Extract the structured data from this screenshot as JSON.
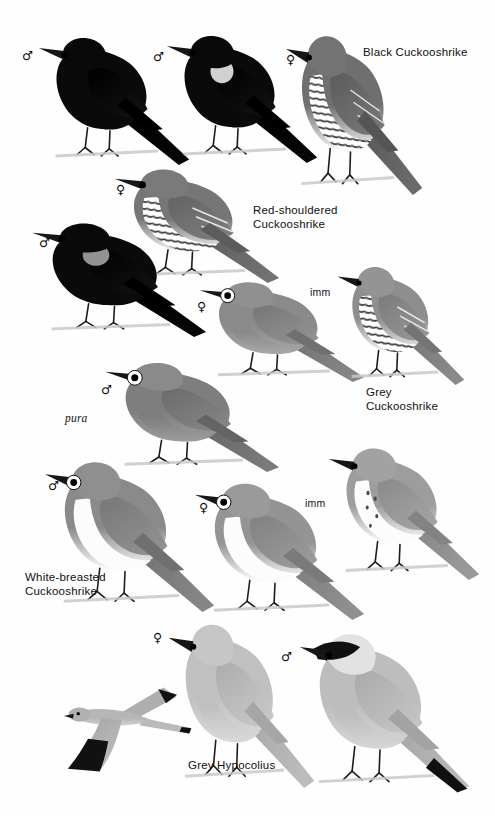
{
  "plate": {
    "title": "Cuckooshrikes and Grey Hypocolius",
    "width": 495,
    "height": 816,
    "background": "#ffffff"
  },
  "species_labels": [
    {
      "name": "black-cuckooshrike",
      "text": "Black Cuckooshrike",
      "x": 363,
      "y": 46
    },
    {
      "name": "red-shouldered-cuckooshrike",
      "text": "Red-shouldered\nCuckooshrike",
      "x": 253,
      "y": 204
    },
    {
      "name": "grey-cuckooshrike",
      "text": "Grey\nCuckooshrike",
      "x": 366,
      "y": 386
    },
    {
      "name": "white-breasted-cuckooshrike",
      "text": "White-breasted\nCuckooshrike",
      "x": 25,
      "y": 571
    },
    {
      "name": "grey-hypocolius",
      "text": "Grey Hypocolius",
      "x": 188,
      "y": 759
    }
  ],
  "age_labels": [
    {
      "name": "imm-grey-cuckooshrike",
      "text": "imm",
      "x": 310,
      "y": 286
    },
    {
      "name": "imm-white-breasted-cuckooshrike",
      "text": "imm",
      "x": 305,
      "y": 497
    }
  ],
  "subspecies_labels": [
    {
      "name": "pura-subspecies",
      "text": "pura",
      "x": 65,
      "y": 412
    }
  ],
  "sex_symbols": [
    {
      "name": "male-black-cuckooshrike-left",
      "symbol": "♂",
      "x": 22,
      "y": 50
    },
    {
      "name": "male-black-cuckooshrike-right",
      "symbol": "♂",
      "x": 153,
      "y": 51
    },
    {
      "name": "female-black-cuckooshrike",
      "symbol": "♀",
      "x": 286,
      "y": 54
    },
    {
      "name": "female-red-shouldered-cuckooshrike",
      "symbol": "♀",
      "x": 116,
      "y": 184
    },
    {
      "name": "male-red-shouldered-cuckooshrike",
      "symbol": "♂",
      "x": 39,
      "y": 237
    },
    {
      "name": "female-grey-cuckooshrike",
      "symbol": "♀",
      "x": 197,
      "y": 301
    },
    {
      "name": "male-grey-cuckooshrike-pura",
      "symbol": "♂",
      "x": 101,
      "y": 384
    },
    {
      "name": "male-white-breasted-cuckooshrike",
      "symbol": "♂",
      "x": 48,
      "y": 480
    },
    {
      "name": "female-white-breasted-cuckooshrike",
      "symbol": "♀",
      "x": 199,
      "y": 502
    },
    {
      "name": "female-grey-hypocolius",
      "symbol": "♀",
      "x": 153,
      "y": 632
    },
    {
      "name": "male-grey-hypocolius",
      "symbol": "♂",
      "x": 281,
      "y": 651
    }
  ],
  "figures": [
    {
      "name": "black-cuckooshrike-male-plain",
      "species": "Black Cuckooshrike",
      "plumage": "adult male, all black",
      "pose": "perched",
      "x": 30,
      "y": 25,
      "w": 160,
      "h": 140
    },
    {
      "name": "black-cuckooshrike-male-shoulder",
      "species": "Black Cuckooshrike",
      "plumage": "adult male with white shoulder patch",
      "pose": "perched",
      "x": 158,
      "y": 23,
      "w": 160,
      "h": 140
    },
    {
      "name": "black-cuckooshrike-female",
      "species": "Black Cuckooshrike",
      "plumage": "adult female, barred underparts",
      "pose": "perched",
      "x": 278,
      "y": 20,
      "w": 145,
      "h": 175
    },
    {
      "name": "red-shouldered-cuckooshrike-female",
      "species": "Red-shouldered Cuckooshrike",
      "plumage": "adult female, barred underparts",
      "pose": "perched",
      "x": 105,
      "y": 158,
      "w": 175,
      "h": 125
    },
    {
      "name": "red-shouldered-cuckooshrike-male",
      "species": "Red-shouldered Cuckooshrike",
      "plumage": "adult male, black with pale shoulder patch",
      "pose": "perched",
      "x": 22,
      "y": 212,
      "w": 185,
      "h": 125
    },
    {
      "name": "grey-cuckooshrike-female",
      "species": "Grey Cuckooshrike",
      "plumage": "adult female, plain grey",
      "pose": "perched",
      "x": 190,
      "y": 272,
      "w": 175,
      "h": 110
    },
    {
      "name": "grey-cuckooshrike-immature",
      "species": "Grey Cuckooshrike",
      "plumage": "immature, barred underparts",
      "pose": "perched",
      "x": 330,
      "y": 255,
      "w": 135,
      "h": 130
    },
    {
      "name": "grey-cuckooshrike-male-pura",
      "species": "Grey Cuckooshrike",
      "plumage": "adult male, subspecies pura",
      "pose": "perched",
      "x": 95,
      "y": 352,
      "w": 185,
      "h": 120
    },
    {
      "name": "white-breasted-cuckooshrike-male",
      "species": "White-breasted Cuckooshrike",
      "plumage": "adult male, grey above, white below",
      "pose": "perched",
      "x": 35,
      "y": 447,
      "w": 180,
      "h": 165
    },
    {
      "name": "white-breasted-cuckooshrike-female",
      "species": "White-breasted Cuckooshrike",
      "plumage": "adult female",
      "pose": "perched",
      "x": 185,
      "y": 470,
      "w": 180,
      "h": 150
    },
    {
      "name": "white-breasted-cuckooshrike-immature",
      "species": "White-breasted Cuckooshrike",
      "plumage": "immature, spotted breast",
      "pose": "perched",
      "x": 320,
      "y": 435,
      "w": 160,
      "h": 145
    },
    {
      "name": "grey-hypocolius-female",
      "species": "Grey Hypocolius",
      "plumage": "adult female, plain sandy grey",
      "pose": "perched",
      "x": 160,
      "y": 608,
      "w": 155,
      "h": 180
    },
    {
      "name": "grey-hypocolius-male",
      "species": "Grey Hypocolius",
      "plumage": "adult male, black face mask and tail band",
      "pose": "perched",
      "x": 290,
      "y": 618,
      "w": 180,
      "h": 175
    },
    {
      "name": "grey-hypocolius-flight",
      "species": "Grey Hypocolius",
      "plumage": "male in flight, black wingtips",
      "pose": "flight",
      "x": 62,
      "y": 678,
      "w": 130,
      "h": 95
    }
  ],
  "colors": {
    "black_plumage": "#0b0b0b",
    "dark_grey": "#4a4a4a",
    "mid_grey": "#8b8b8b",
    "light_grey": "#b9b9b9",
    "pale_grey": "#d8d8d8",
    "white": "#ffffff",
    "bill_black": "#151515",
    "label_text": "#101010",
    "background": "#ffffff"
  }
}
